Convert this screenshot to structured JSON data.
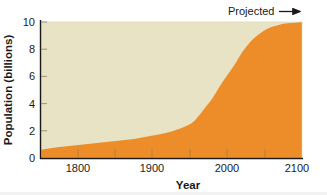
{
  "chart_data": {
    "type": "area",
    "title": "",
    "xlabel": "Year",
    "ylabel": "Population (billions)",
    "xlim": [
      1750,
      2100
    ],
    "ylim": [
      0,
      10
    ],
    "xticks": [
      1800,
      1900,
      2000,
      2100
    ],
    "xtick_labels": [
      "1800",
      "1900",
      "2000",
      "2100"
    ],
    "yticks": [
      0,
      2,
      4,
      6,
      8,
      10
    ],
    "ytick_labels": [
      "0",
      "2",
      "4",
      "6",
      "8",
      "10"
    ],
    "minor_xticks": [
      1750,
      1850,
      1950,
      2050
    ],
    "grid": false,
    "legend": null,
    "series": [
      {
        "name": "World population",
        "color": "#ED8D2A",
        "x": [
          1750,
          1775,
          1800,
          1825,
          1850,
          1875,
          1900,
          1925,
          1950,
          1960,
          1970,
          1980,
          1990,
          2000,
          2010,
          2020,
          2030,
          2040,
          2050,
          2060,
          2070,
          2080,
          2090,
          2100
        ],
        "values": [
          0.6,
          0.8,
          0.95,
          1.1,
          1.25,
          1.4,
          1.65,
          1.95,
          2.5,
          3.0,
          3.7,
          4.4,
          5.3,
          6.1,
          6.9,
          7.8,
          8.5,
          9.0,
          9.4,
          9.65,
          9.8,
          9.9,
          9.95,
          10.0
        ]
      }
    ],
    "annotations": [
      {
        "text": "Projected",
        "arrow": "right",
        "x": 2065,
        "y": 10.6
      }
    ],
    "colors": {
      "area_fill": "#ED8D2A",
      "plot_background": "#E8E3C4",
      "axis": "#1a1a1a",
      "text": "#1a1a1a",
      "page_background": "#ffffff"
    }
  },
  "figure": {
    "ylabel": "Population (billions)",
    "xlabel": "Year",
    "projected_label": "Projected",
    "arrow_icon": "arrow-right-icon"
  }
}
